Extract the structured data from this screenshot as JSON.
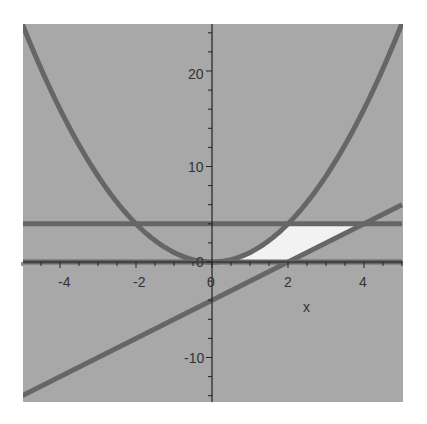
{
  "chart_data": {
    "type": "line",
    "title": "",
    "xlabel": "x",
    "ylabel": "",
    "xlim": [
      -5,
      5
    ],
    "ylim": [
      -15,
      25
    ],
    "grid": false,
    "x_ticks": [
      "-4",
      "-2",
      "0",
      "2",
      "4"
    ],
    "y_ticks": [
      "-10",
      "0",
      "10",
      "20"
    ],
    "series": [
      {
        "name": "y = x^2",
        "x": [
          -5,
          -4,
          -3,
          -2,
          -1,
          0,
          1,
          2,
          3,
          4,
          5
        ],
        "values": [
          25,
          16,
          9,
          4,
          1,
          0,
          1,
          4,
          9,
          16,
          25
        ]
      },
      {
        "name": "y = 4",
        "x": [
          -5,
          5
        ],
        "values": [
          4,
          4
        ]
      },
      {
        "name": "y = 0",
        "x": [
          -5,
          5
        ],
        "values": [
          0,
          0
        ]
      },
      {
        "name": "y = 2x - 4",
        "x": [
          -5,
          5
        ],
        "values": [
          -14,
          6
        ]
      }
    ],
    "shaded_region": {
      "description": "Region bounded by y = x^2, y = 2x - 4, y = 0 and y = 4",
      "x_range": [
        0,
        4
      ],
      "y_range": [
        0,
        4
      ]
    }
  },
  "colors": {
    "background": "#a8a8a8",
    "curve": "#666666",
    "fill": "#f2f2f2",
    "axis": "#222222"
  },
  "labels": {
    "x_axis": "x",
    "tick_x_m4": "-4",
    "tick_x_m2": "-2",
    "tick_x_0": "0",
    "tick_x_2": "2",
    "tick_x_4": "4",
    "tick_y_20": "20",
    "tick_y_10": "10",
    "tick_y_0": "0",
    "tick_y_m10": "-10"
  }
}
